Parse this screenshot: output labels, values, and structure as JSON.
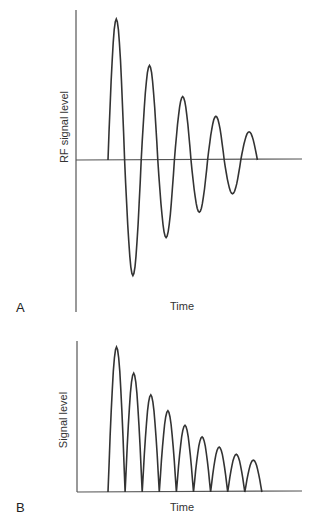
{
  "chart_data": [
    {
      "panel": "A",
      "type": "line",
      "title": "",
      "xlabel": "Time",
      "ylabel": "RF signal level",
      "grid": false,
      "legend": null,
      "description": "Damped sinusoid (free induction decay), oscillating above and below zero with exponentially decaying amplitude",
      "series": [
        {
          "name": "RF signal",
          "peaks": [
            {
              "t": 1,
              "value": 1.0
            },
            {
              "t": 2,
              "value": -0.82
            },
            {
              "t": 3,
              "value": 0.67
            },
            {
              "t": 4,
              "value": -0.55
            },
            {
              "t": 5,
              "value": 0.45
            },
            {
              "t": 6,
              "value": -0.37
            },
            {
              "t": 7,
              "value": 0.31
            },
            {
              "t": 8,
              "value": -0.24
            },
            {
              "t": 9,
              "value": 0.2
            }
          ]
        }
      ],
      "ylim": [
        -1,
        1
      ]
    },
    {
      "panel": "B",
      "type": "line",
      "title": "",
      "xlabel": "Time",
      "ylabel": "Signal level",
      "grid": false,
      "legend": null,
      "description": "Rectified (absolute value) damped signal: successive positive lobes of decreasing height",
      "series": [
        {
          "name": "Signal",
          "lobe_heights": [
            1.0,
            0.82,
            0.67,
            0.56,
            0.46,
            0.38,
            0.31,
            0.26,
            0.22
          ]
        }
      ],
      "ylim": [
        0,
        1
      ]
    }
  ],
  "panels": {
    "a": {
      "letter": "A",
      "xlabel": "Time",
      "ylabel": "RF signal level"
    },
    "b": {
      "letter": "B",
      "xlabel": "Time",
      "ylabel": "Signal level"
    }
  },
  "colors": {
    "line": "#333333",
    "axis": "#555555",
    "background": "#ffffff"
  }
}
